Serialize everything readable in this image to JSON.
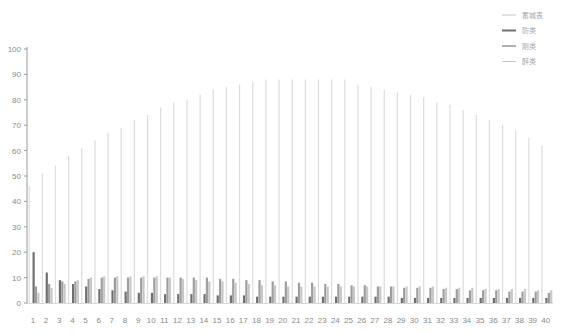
{
  "chart_data": {
    "type": "bar",
    "title": "",
    "xlabel": "",
    "ylabel": "",
    "ylim": [
      0,
      100
    ],
    "yticks": [
      0,
      10,
      20,
      30,
      40,
      50,
      60,
      70,
      80,
      90,
      100
    ],
    "grid": false,
    "legend_position": "top-right",
    "categories": [
      "1",
      "2",
      "3",
      "4",
      "5",
      "6",
      "7",
      "8",
      "9",
      "10",
      "11",
      "12",
      "13",
      "14",
      "15",
      "16",
      "17",
      "18",
      "19",
      "20",
      "21",
      "22",
      "23",
      "24",
      "25",
      "26",
      "27",
      "28",
      "29",
      "30",
      "31",
      "32",
      "33",
      "34",
      "35",
      "36",
      "37",
      "38",
      "39",
      "40"
    ],
    "series": [
      {
        "name": "蓄城表",
        "color": "#dcdcdc",
        "values": [
          46,
          51,
          54,
          58,
          61,
          64,
          67,
          69,
          72,
          74,
          77,
          79,
          80,
          82,
          84,
          85,
          86,
          87,
          88,
          88,
          88,
          88,
          88,
          88,
          88,
          86,
          85,
          84,
          83,
          82,
          81,
          79,
          78,
          76,
          74,
          72,
          70,
          68,
          65,
          62
        ]
      },
      {
        "name": "防类",
        "color": "#6f6f6f",
        "values": [
          20,
          12,
          9,
          7.5,
          6.5,
          5.5,
          5,
          4.5,
          4,
          4,
          3.5,
          3.5,
          3.5,
          3.5,
          3,
          3,
          3,
          2.5,
          2.5,
          2.5,
          2.5,
          2.5,
          2.5,
          2.5,
          2.5,
          2.5,
          2.5,
          2.5,
          2,
          2,
          2,
          2,
          2,
          2,
          2,
          2,
          2,
          2,
          2,
          2
        ]
      },
      {
        "name": "刚类",
        "color": "#9e9e9e",
        "values": [
          6.5,
          7.5,
          8.5,
          8.5,
          9.5,
          10,
          10,
          10,
          10,
          10,
          10,
          10,
          10,
          10,
          9.5,
          9.5,
          9,
          9,
          8.5,
          8.5,
          8,
          8,
          7.5,
          7.5,
          7,
          7,
          6.5,
          6.5,
          6,
          6,
          6,
          5.5,
          5.5,
          5,
          5,
          5,
          4.5,
          4.5,
          4.5,
          4
        ]
      },
      {
        "name": "醉类",
        "color": "#c8c8c8",
        "values": [
          4,
          6,
          7.5,
          9,
          10,
          10.5,
          10.5,
          10.5,
          10.5,
          10.5,
          10,
          9.5,
          9,
          8.5,
          8.5,
          8,
          7.5,
          7,
          7,
          6.5,
          6.5,
          6.5,
          6.5,
          6.5,
          6.5,
          6.5,
          6.5,
          6.5,
          6.5,
          6.5,
          6.5,
          6,
          6,
          6,
          5.5,
          5.5,
          5.5,
          5.5,
          5,
          5
        ]
      }
    ]
  }
}
